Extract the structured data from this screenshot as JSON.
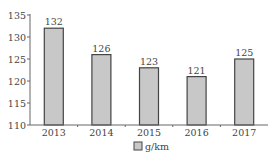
{
  "chart_data": {
    "type": "bar",
    "title": "",
    "xlabel": "",
    "ylabel": "",
    "categories": [
      "2013",
      "2014",
      "2015",
      "2016",
      "2017"
    ],
    "values": [
      132,
      126,
      123,
      121,
      125
    ],
    "data_labels": [
      "132",
      "126",
      "123",
      "121",
      "125"
    ],
    "yticks": [
      "110",
      "115",
      "120",
      "125",
      "130",
      "135"
    ],
    "ylim": [
      110,
      135
    ],
    "grid": false,
    "legend": {
      "position": "bottom",
      "entries": [
        "g/km"
      ]
    },
    "bar_color": "#c8c8c8",
    "bar_edge": "#444444"
  }
}
